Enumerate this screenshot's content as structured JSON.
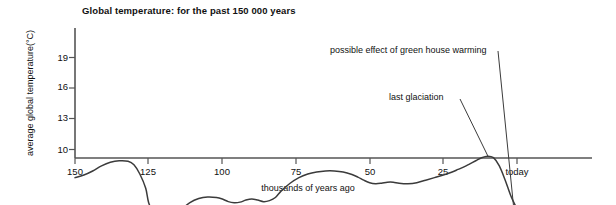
{
  "chart_data": {
    "type": "line",
    "title": "Global temperature: for the past 150 000 years",
    "xlabel": "thousands of years ago",
    "ylabel": "average global temperature(°C)",
    "xlim": [
      150,
      -8
    ],
    "ylim": [
      9.3,
      20.4
    ],
    "x_ticks": [
      {
        "value": 150,
        "label": "150"
      },
      {
        "value": 125,
        "label": "125"
      },
      {
        "value": 100,
        "label": "100"
      },
      {
        "value": 75,
        "label": "75"
      },
      {
        "value": 50,
        "label": "50"
      },
      {
        "value": 25,
        "label": "25"
      },
      {
        "value": 0,
        "label": "today"
      }
    ],
    "y_ticks": [
      {
        "value": 10,
        "label": "10"
      },
      {
        "value": 13,
        "label": "13"
      },
      {
        "value": 16,
        "label": "16"
      },
      {
        "value": 19,
        "label": "19"
      }
    ],
    "grid": false,
    "legend": false,
    "series": [
      {
        "name": "observed temperature",
        "style": "solid",
        "x": [
          150,
          147,
          144,
          141,
          138,
          135,
          132,
          130,
          128,
          126,
          125,
          123,
          121,
          119,
          117,
          114,
          111,
          108,
          105,
          102,
          100,
          98,
          96,
          94,
          92,
          90,
          88,
          86,
          84,
          82,
          80,
          77,
          74,
          71,
          68,
          65,
          62,
          59,
          56,
          54,
          52,
          50,
          48,
          46,
          44,
          42,
          40,
          37,
          34,
          31,
          28,
          25,
          22,
          20,
          18,
          16,
          14,
          12,
          10,
          8,
          6,
          4,
          2,
          0
        ],
        "y": [
          12.75,
          12.5,
          12.1,
          11.6,
          11.25,
          11.1,
          11.15,
          11.5,
          12.4,
          13.8,
          15.2,
          16.4,
          16.9,
          17.0,
          16.7,
          15.9,
          15.2,
          14.8,
          14.65,
          14.7,
          14.85,
          15.1,
          15.2,
          15.15,
          14.95,
          14.85,
          14.95,
          15.1,
          15.0,
          14.7,
          14.05,
          13.3,
          12.75,
          12.4,
          12.2,
          12.1,
          12.1,
          12.2,
          12.45,
          12.7,
          13.0,
          13.25,
          13.35,
          13.3,
          13.2,
          13.2,
          13.3,
          13.35,
          13.25,
          13.0,
          12.75,
          12.5,
          12.2,
          11.95,
          11.7,
          11.4,
          11.1,
          10.8,
          10.65,
          10.8,
          11.6,
          13.0,
          14.6,
          15.8
        ],
        "annotations": [
          "last glaciation"
        ]
      },
      {
        "name": "possible effect of green house warming",
        "style": "dashed",
        "x": [
          0,
          -0.6,
          -1.2,
          -1.9,
          -2.6,
          -3.4,
          -4.2,
          -5.0,
          -5.8,
          -6.6
        ],
        "y": [
          15.85,
          17.3,
          18.4,
          18.75,
          18.85,
          18.8,
          18.6,
          18.3,
          17.9,
          17.5
        ]
      }
    ],
    "annotations": [
      {
        "name": "last-glaciation",
        "text": "last glaciation",
        "text_x": 37.5,
        "text_y": 15.4,
        "point_x": 10.2,
        "point_y": 10.75
      },
      {
        "name": "greenhouse-warming",
        "text": "possible effect of green house warming",
        "text_x": 60,
        "text_y": 19.1,
        "point_x": -0.6,
        "point_y": 18.7
      }
    ]
  },
  "style": {
    "line_color": "#3b3b3b",
    "axis_color": "#555555",
    "text_color": "#111111",
    "background": "#ffffff"
  }
}
